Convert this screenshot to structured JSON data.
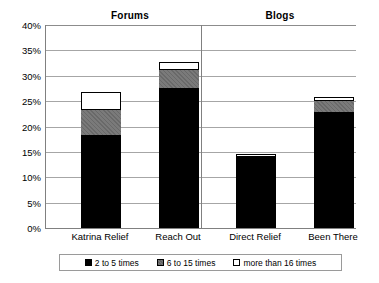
{
  "chart_data": {
    "type": "bar",
    "subtype": "stacked-bar",
    "title": "",
    "xlabel": "",
    "ylabel": "",
    "ylim": [
      0,
      40
    ],
    "ytick_labels": [
      "0%",
      "5%",
      "10%",
      "15%",
      "20%",
      "25%",
      "30%",
      "35%",
      "40%"
    ],
    "ytick_values": [
      0,
      5,
      10,
      15,
      20,
      25,
      30,
      35,
      40
    ],
    "grid": true,
    "legend_position": "bottom",
    "categories": [
      "Katrina Relief",
      "Reach Out",
      "Direct Relief",
      "Been There"
    ],
    "groups": [
      {
        "label": "Forums",
        "categories": [
          "Katrina Relief",
          "Reach Out"
        ]
      },
      {
        "label": "Blogs",
        "categories": [
          "Direct Relief",
          "Been There"
        ]
      }
    ],
    "series": [
      {
        "name": "2 to 5 times",
        "color": "#000000",
        "values": [
          18.3,
          27.6,
          14.2,
          22.8
        ]
      },
      {
        "name": "6 to 15 times",
        "color": "#7a7a7a",
        "values": [
          5.2,
          3.8,
          0.0,
          2.5
        ]
      },
      {
        "name": "more than 16 times",
        "color": "#ffffff",
        "values": [
          3.3,
          1.4,
          0.3,
          0.6
        ]
      }
    ],
    "totals": [
      26.8,
      32.8,
      14.5,
      25.9
    ]
  },
  "legend": {
    "entries": [
      {
        "label": "2 to 5 times"
      },
      {
        "label": "6 to 15 times"
      },
      {
        "label": "more than 16 times"
      }
    ]
  },
  "axes": {
    "y_labels": [
      "40%",
      "35%",
      "30%",
      "25%",
      "20%",
      "15%",
      "10%",
      "5%",
      "0%"
    ]
  }
}
